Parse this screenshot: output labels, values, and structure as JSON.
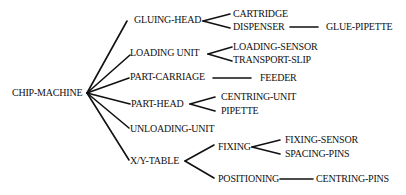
{
  "diagram": {
    "type": "tree",
    "root": "CHIP-MACHINE",
    "nodes": {
      "root": "CHIP-MACHINE",
      "gluing_head": "GLUING-HEAD",
      "cartridge": "CARTRIDGE",
      "dispenser": "DISPENSER",
      "glue_pipette": "GLUE-PIPETTE",
      "loading_unit": "LOADING UNIT",
      "loading_sensor": "LOADING-SENSOR",
      "transport_slip": "TRANSPORT-SLIP",
      "part_carriage": "PART-CARRIAGE",
      "feeder": "FEEDER",
      "part_head": "PART-HEAD",
      "centring_unit": "CENTRING-UNIT",
      "pipette": "PIPETTE",
      "unloading_unit": "UNLOADING-UNIT",
      "xy_table": "X/Y-TABLE",
      "fixing": "FIXING",
      "fixing_sensor": "FIXING-SENSOR",
      "spacing_pins": "SPACING-PINS",
      "positioning": "POSITIONING",
      "centring_pins": "CENTRING-PINS"
    },
    "edges": [
      [
        "CHIP-MACHINE",
        "GLUING-HEAD"
      ],
      [
        "CHIP-MACHINE",
        "LOADING UNIT"
      ],
      [
        "CHIP-MACHINE",
        "PART-CARRIAGE"
      ],
      [
        "CHIP-MACHINE",
        "PART-HEAD"
      ],
      [
        "CHIP-MACHINE",
        "UNLOADING-UNIT"
      ],
      [
        "CHIP-MACHINE",
        "X/Y-TABLE"
      ],
      [
        "GLUING-HEAD",
        "CARTRIDGE"
      ],
      [
        "GLUING-HEAD",
        "DISPENSER"
      ],
      [
        "DISPENSER",
        "GLUE-PIPETTE"
      ],
      [
        "LOADING UNIT",
        "LOADING-SENSOR"
      ],
      [
        "LOADING UNIT",
        "TRANSPORT-SLIP"
      ],
      [
        "PART-CARRIAGE",
        "FEEDER"
      ],
      [
        "PART-HEAD",
        "CENTRING-UNIT"
      ],
      [
        "PART-HEAD",
        "PIPETTE"
      ],
      [
        "X/Y-TABLE",
        "FIXING"
      ],
      [
        "X/Y-TABLE",
        "POSITIONING"
      ],
      [
        "FIXING",
        "FIXING-SENSOR"
      ],
      [
        "FIXING",
        "SPACING-PINS"
      ],
      [
        "POSITIONING",
        "CENTRING-PINS"
      ]
    ],
    "line_color": "#111111"
  }
}
